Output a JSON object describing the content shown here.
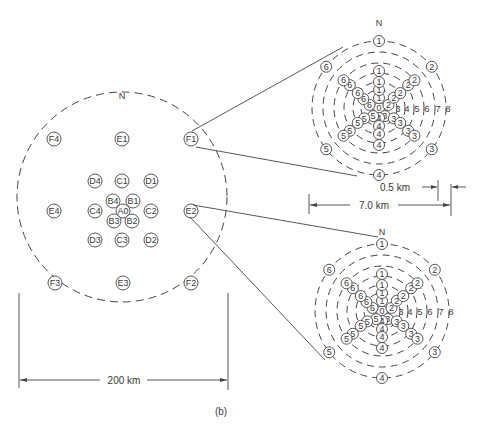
{
  "figure_label": "(b)",
  "main_array": {
    "north_label": "N",
    "scale_label": "200 km",
    "stations": [
      {
        "id": "F4",
        "x": 54,
        "y": 139
      },
      {
        "id": "E1",
        "x": 122,
        "y": 139
      },
      {
        "id": "F1",
        "x": 191,
        "y": 139
      },
      {
        "id": "D4",
        "x": 95,
        "y": 181
      },
      {
        "id": "C1",
        "x": 122,
        "y": 181
      },
      {
        "id": "D1",
        "x": 151,
        "y": 181
      },
      {
        "id": "B4",
        "x": 113,
        "y": 201
      },
      {
        "id": "B1",
        "x": 133,
        "y": 201
      },
      {
        "id": "E4",
        "x": 54,
        "y": 211
      },
      {
        "id": "C4",
        "x": 95,
        "y": 211
      },
      {
        "id": "A0",
        "x": 123,
        "y": 211
      },
      {
        "id": "C2",
        "x": 151,
        "y": 211
      },
      {
        "id": "E2",
        "x": 191,
        "y": 211
      },
      {
        "id": "B3",
        "x": 114,
        "y": 221
      },
      {
        "id": "B2",
        "x": 132,
        "y": 221
      },
      {
        "id": "D3",
        "x": 95,
        "y": 240
      },
      {
        "id": "C3",
        "x": 122,
        "y": 240
      },
      {
        "id": "D2",
        "x": 151,
        "y": 240
      },
      {
        "id": "F3",
        "x": 55,
        "y": 283
      },
      {
        "id": "E3",
        "x": 123,
        "y": 283
      },
      {
        "id": "F2",
        "x": 191,
        "y": 283
      }
    ]
  },
  "subarray_top": {
    "source_station": "F1",
    "north_label": "N",
    "inner_scale_label": "0.5 km",
    "outer_scale_label": "7.0 km",
    "ring_labels": [
      "3",
      "4",
      "5",
      "6",
      "7",
      "8"
    ]
  },
  "subarray_bottom": {
    "source_station": "E2",
    "north_label": "N",
    "ring_labels": [
      "3",
      "4",
      "5",
      "6",
      "7",
      "8"
    ]
  }
}
